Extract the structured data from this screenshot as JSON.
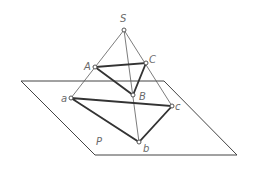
{
  "diagram": {
    "plane": {
      "label": "P",
      "corners": [
        [
          21,
          81
        ],
        [
          164,
          81
        ],
        [
          237,
          155
        ],
        [
          95,
          155
        ]
      ],
      "label_pos": [
        96,
        145
      ]
    },
    "points": {
      "S": {
        "label": "S",
        "xy": [
          124,
          30
        ],
        "label_pos": [
          120,
          22
        ]
      },
      "A": {
        "label": "A",
        "xy": [
          95,
          67
        ],
        "label_pos": [
          84,
          70
        ]
      },
      "C": {
        "label": "C",
        "xy": [
          146,
          63
        ],
        "label_pos": [
          149,
          63
        ]
      },
      "B": {
        "label": "B",
        "xy": [
          133,
          95
        ],
        "label_pos": [
          139,
          100
        ]
      },
      "a": {
        "label": "a",
        "xy": [
          71,
          98
        ],
        "label_pos": [
          61,
          102
        ]
      },
      "c": {
        "label": "c",
        "xy": [
          172,
          106
        ],
        "label_pos": [
          175,
          110
        ]
      },
      "b": {
        "label": "b",
        "xy": [
          139,
          142
        ],
        "label_pos": [
          143,
          152
        ]
      }
    },
    "projection_rays": [
      [
        "S",
        "a"
      ],
      [
        "S",
        "b"
      ],
      [
        "S",
        "c"
      ]
    ],
    "triangles": [
      [
        "A",
        "B",
        "C"
      ],
      [
        "a",
        "b",
        "c"
      ]
    ],
    "colors": {
      "line": "#333333",
      "thin_line": "#5a5a5a",
      "label": "#6a6a6a",
      "background": "#ffffff"
    }
  }
}
